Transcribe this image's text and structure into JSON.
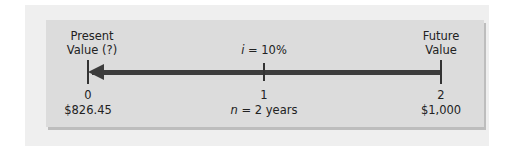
{
  "diagram": {
    "type": "timeline",
    "left_label": [
      "Present",
      "Value (?)"
    ],
    "right_label": [
      "Future",
      "Value"
    ],
    "rate_var": "i",
    "rate_text": " = 10%",
    "periods": [
      "0",
      "1",
      "2"
    ],
    "present_value": "$826.45",
    "future_value": "$1,000",
    "n_var": "n",
    "n_text": " = 2 years",
    "arrow_direction": "right-to-left",
    "colors": {
      "panel": "#efefef",
      "box": "#dcdcdc",
      "line": "#3c3c3c"
    }
  }
}
